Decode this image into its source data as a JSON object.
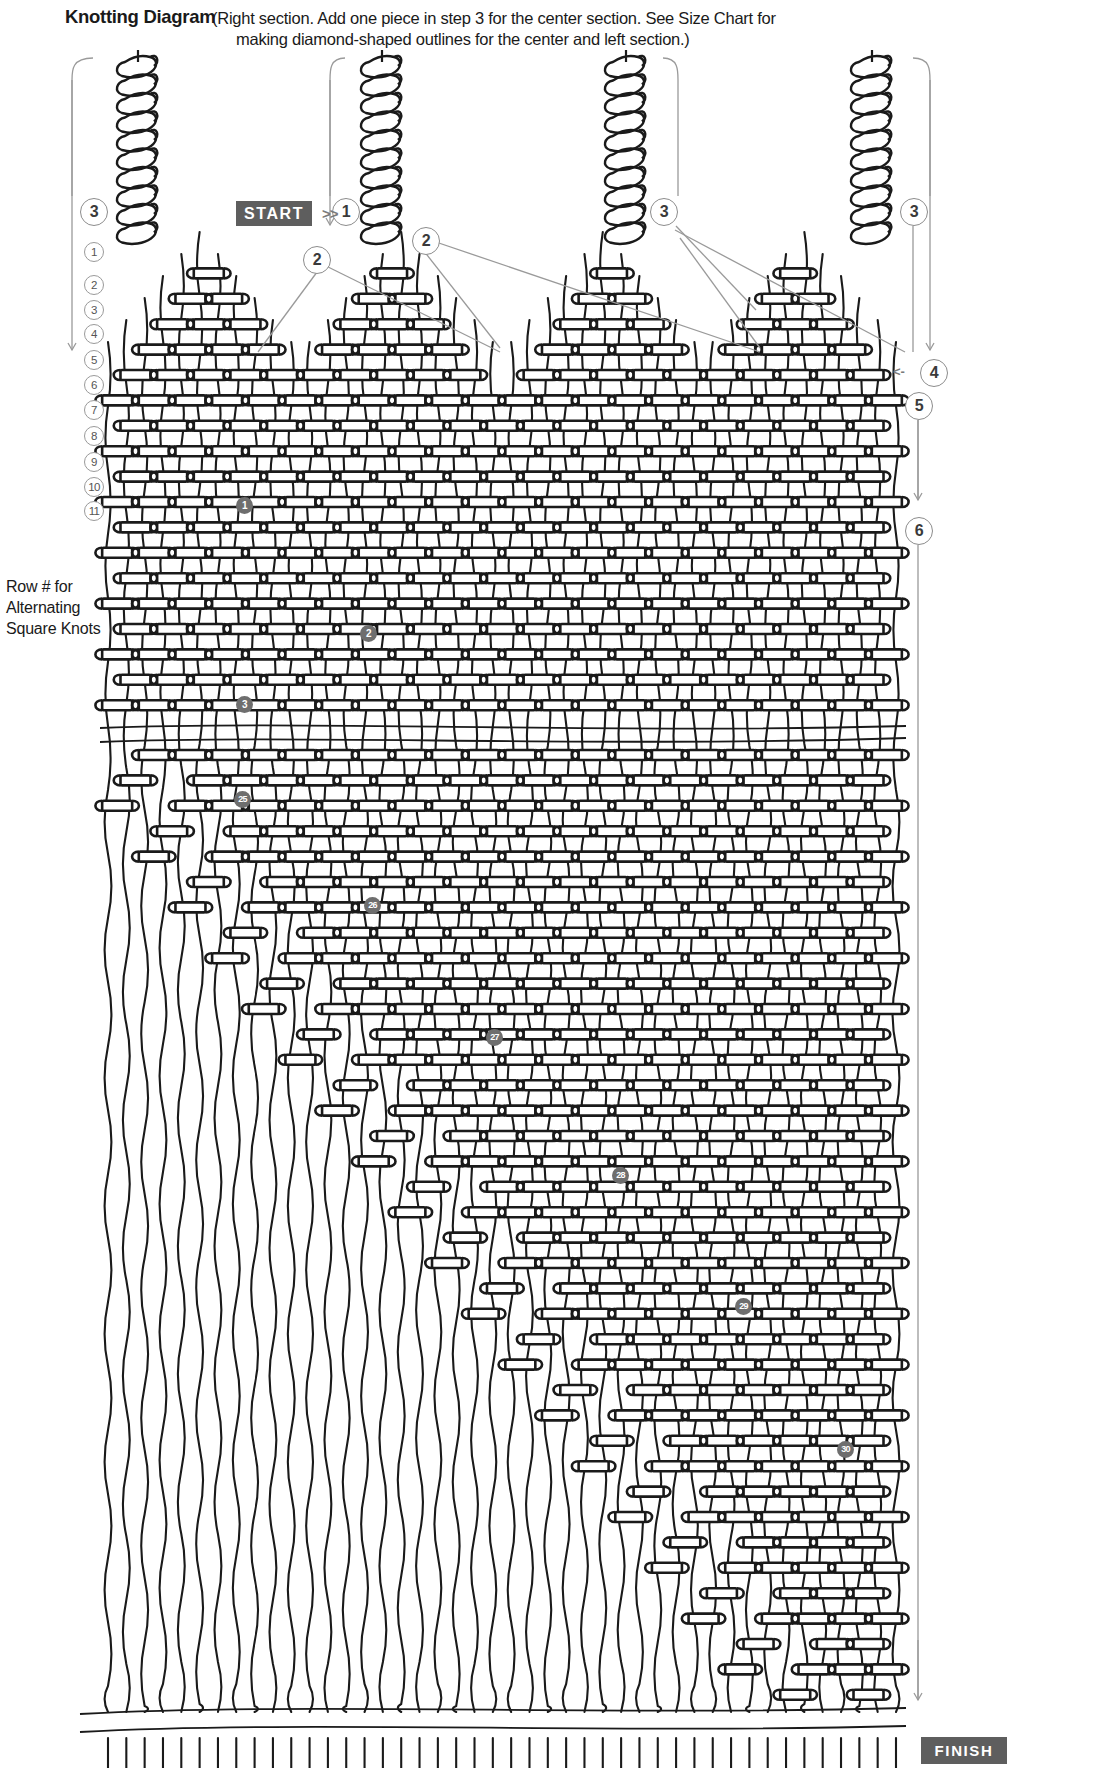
{
  "header": {
    "title": "Knotting Diagram",
    "note_line1": "(Right section. Add one piece in step 3 for the center section. See Size Chart for",
    "note_line2": "making diamond-shaped outlines for the center and left section.)"
  },
  "legend": {
    "row_label_line1": "Row # for",
    "row_label_line2": "Alternating",
    "row_label_line3": "Square Knots",
    "row_numbers": [
      "1",
      "2",
      "3",
      "4",
      "5",
      "6",
      "7",
      "8",
      "9",
      "10",
      "11"
    ]
  },
  "controls": {
    "start_label": "START",
    "start_chevrons": ">>",
    "finish_label": "FINISH",
    "left_arrow_glyph": "<-"
  },
  "step_markers": [
    {
      "id": "marker-left-3",
      "label": "3",
      "x": 80,
      "y": 198
    },
    {
      "id": "marker-top-1",
      "label": "1",
      "x": 332,
      "y": 198
    },
    {
      "id": "marker-left-2",
      "label": "2",
      "x": 303,
      "y": 246
    },
    {
      "id": "marker-mid-2",
      "label": "2",
      "x": 412,
      "y": 227
    },
    {
      "id": "marker-right-3a",
      "label": "3",
      "x": 650,
      "y": 198
    },
    {
      "id": "marker-right-3b",
      "label": "3",
      "x": 900,
      "y": 198
    },
    {
      "id": "marker-right-4",
      "label": "4",
      "x": 920,
      "y": 359
    },
    {
      "id": "marker-right-5",
      "label": "5",
      "x": 905,
      "y": 392
    },
    {
      "id": "marker-right-6",
      "label": "6",
      "x": 905,
      "y": 517
    }
  ],
  "knot_badges": [
    {
      "label": "1",
      "x": 236,
      "y": 497
    },
    {
      "label": "2",
      "x": 360,
      "y": 625
    },
    {
      "label": "3",
      "x": 236,
      "y": 696
    },
    {
      "label": "25",
      "x": 234,
      "y": 791
    },
    {
      "label": "26",
      "x": 364,
      "y": 897
    },
    {
      "label": "27",
      "x": 486,
      "y": 1029
    },
    {
      "label": "28",
      "x": 612,
      "y": 1167
    },
    {
      "label": "29",
      "x": 735,
      "y": 1298
    },
    {
      "label": "30",
      "x": 837,
      "y": 1441
    }
  ],
  "colors": {
    "cord": "#1a1a1a",
    "guide_line": "#9a9a9a",
    "plate_bg": "#5e5e5e",
    "badge_bg": "#6e6e6e",
    "background": "#ffffff"
  },
  "structure": {
    "sinnet_columns_x": [
      138,
      382,
      626,
      872
    ],
    "break_line_y": 727,
    "fringe_line_y": 1712,
    "total_cord_columns": 44
  }
}
